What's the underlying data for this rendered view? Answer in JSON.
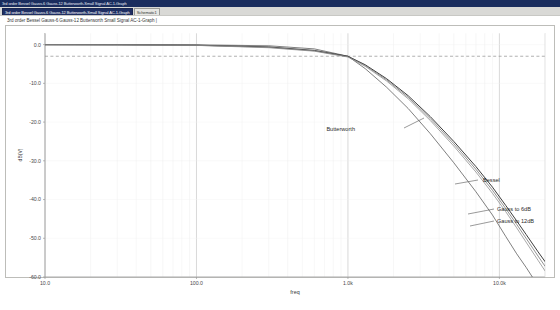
{
  "window": {
    "title": "3rd order Bessel Gauss-6 Gauss-12 Butterworth-Small Signal AC-1-Graph",
    "title_bar_color": "#1a2d5e"
  },
  "tabs": [
    {
      "label": "3rd order Bessel Gauss-6 Gauss-12 Butterworth-Small Signal AC-1-Graph",
      "active": true
    },
    {
      "label": "Schematic1",
      "active": false
    }
  ],
  "document": {
    "header": "3rd order Bessel Gauss-6 Gauss-12 Butterworth  Small Signal AC-1-Graph |"
  },
  "chart_data": {
    "type": "line",
    "title": "",
    "xlabel": "freq",
    "ylabel": "dB(V)",
    "xscale": "log",
    "xlim": [
      10,
      20000
    ],
    "ylim": [
      -60,
      3
    ],
    "grid": true,
    "legend_position": "inline-annotations",
    "xticks": [
      {
        "value": 10,
        "label": "10.0"
      },
      {
        "value": 100,
        "label": "100.0"
      },
      {
        "value": 1000,
        "label": "1.0k"
      },
      {
        "value": 10000,
        "label": "10.0k"
      }
    ],
    "yticks": [
      {
        "value": 0,
        "label": "0.0"
      },
      {
        "value": -10,
        "label": "-10.0"
      },
      {
        "value": -20,
        "label": "-20.0"
      },
      {
        "value": -30,
        "label": "-30.0"
      },
      {
        "value": -40,
        "label": "-40.0"
      },
      {
        "value": -50,
        "label": "-50.0"
      },
      {
        "value": -60,
        "label": "-60.0"
      }
    ],
    "reference_line": {
      "value": -3,
      "style": "dashed",
      "label": ""
    },
    "annotations": [
      {
        "text": "Butterworth",
        "x": 355,
        "y": 131
      },
      {
        "text": "Bessel",
        "x": 483,
        "y": 182
      },
      {
        "text": "Gauss to 6dB",
        "x": 497,
        "y": 211
      },
      {
        "text": "Gauss to 12dB",
        "x": 497,
        "y": 223
      }
    ],
    "series": [
      {
        "name": "Butterworth",
        "color": "#555555",
        "points": [
          [
            10,
            -0.02
          ],
          [
            30,
            -0.03
          ],
          [
            100,
            -0.05
          ],
          [
            300,
            -0.3
          ],
          [
            600,
            -1.1
          ],
          [
            900,
            -2.6
          ],
          [
            1000,
            -3.0
          ],
          [
            1300,
            -6.2
          ],
          [
            1800,
            -11.0
          ],
          [
            2500,
            -16.5
          ],
          [
            3500,
            -23.0
          ],
          [
            5000,
            -30.5
          ],
          [
            7000,
            -38.0
          ],
          [
            9000,
            -44.0
          ],
          [
            11000,
            -49.5
          ],
          [
            13000,
            -54.0
          ],
          [
            15000,
            -57.5
          ],
          [
            16500,
            -60.0
          ]
        ]
      },
      {
        "name": "Bessel",
        "color": "#333333",
        "points": [
          [
            10,
            -0.02
          ],
          [
            30,
            -0.05
          ],
          [
            100,
            -0.15
          ],
          [
            300,
            -0.6
          ],
          [
            600,
            -1.5
          ],
          [
            900,
            -2.7
          ],
          [
            1000,
            -3.0
          ],
          [
            1300,
            -5.2
          ],
          [
            1800,
            -8.8
          ],
          [
            2500,
            -13.2
          ],
          [
            3500,
            -18.6
          ],
          [
            5000,
            -25.0
          ],
          [
            7000,
            -31.5
          ],
          [
            9000,
            -36.8
          ],
          [
            11000,
            -41.5
          ],
          [
            13000,
            -45.5
          ],
          [
            15000,
            -49.0
          ],
          [
            18000,
            -53.5
          ],
          [
            20000,
            -56.0
          ]
        ]
      },
      {
        "name": "Gauss to 6dB",
        "color": "#6e6e6e",
        "points": [
          [
            10,
            -0.02
          ],
          [
            30,
            -0.05
          ],
          [
            100,
            -0.18
          ],
          [
            300,
            -0.7
          ],
          [
            600,
            -1.6
          ],
          [
            900,
            -2.8
          ],
          [
            1000,
            -3.1
          ],
          [
            1300,
            -5.4
          ],
          [
            1800,
            -9.1
          ],
          [
            2500,
            -13.6
          ],
          [
            3500,
            -19.1
          ],
          [
            5000,
            -25.6
          ],
          [
            7000,
            -32.2
          ],
          [
            9000,
            -37.6
          ],
          [
            11000,
            -42.3
          ],
          [
            13000,
            -46.4
          ],
          [
            15000,
            -50.0
          ],
          [
            18000,
            -54.6
          ],
          [
            20000,
            -57.2
          ]
        ]
      },
      {
        "name": "Gauss to 12dB",
        "color": "#8a8a8a",
        "points": [
          [
            10,
            -0.02
          ],
          [
            30,
            -0.06
          ],
          [
            100,
            -0.2
          ],
          [
            300,
            -0.8
          ],
          [
            600,
            -1.7
          ],
          [
            900,
            -2.9
          ],
          [
            1000,
            -3.2
          ],
          [
            1300,
            -5.6
          ],
          [
            1800,
            -9.4
          ],
          [
            2500,
            -14.0
          ],
          [
            3500,
            -19.6
          ],
          [
            5000,
            -26.2
          ],
          [
            7000,
            -32.9
          ],
          [
            9000,
            -38.4
          ],
          [
            11000,
            -43.1
          ],
          [
            13000,
            -47.3
          ],
          [
            15000,
            -51.0
          ],
          [
            18000,
            -55.7
          ],
          [
            20000,
            -58.4
          ]
        ]
      }
    ]
  }
}
